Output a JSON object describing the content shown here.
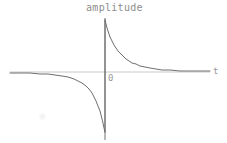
{
  "figure": {
    "background_color": "#ffffff",
    "width": 227,
    "height": 143,
    "title": "amplitude",
    "origin_label": "0",
    "t_axis_label": "t"
  },
  "chart_data": {
    "type": "line",
    "title": "amplitude",
    "xlabel": "t",
    "ylabel": "amplitude",
    "grid": false,
    "legend": null,
    "axes": {
      "x_axis": {
        "label": "t",
        "color": "#c8c8c8",
        "y_pixel": 72,
        "x_start_pixel": 10,
        "x_end_pixel": 210,
        "ticks": [],
        "tick_labels": []
      },
      "y_axis": {
        "label": "amplitude",
        "color": "#707070",
        "x_pixel": 105,
        "y_top_pixel": 18,
        "y_bottom_pixel": 140,
        "ticks": [],
        "tick_labels": []
      }
    },
    "origin": {
      "x_pixel": 105,
      "y_pixel": 72,
      "label": "0"
    },
    "series": [
      {
        "name": "positive-branch",
        "color": "#6e6e6e",
        "line_width": 1,
        "points_pixel": [
          [
            105,
            20
          ],
          [
            106,
            24
          ],
          [
            107,
            28
          ],
          [
            108,
            31
          ],
          [
            109,
            34
          ],
          [
            110,
            37
          ],
          [
            111,
            39
          ],
          [
            112,
            41
          ],
          [
            114,
            45
          ],
          [
            116,
            48
          ],
          [
            118,
            51
          ],
          [
            120,
            53
          ],
          [
            123,
            56
          ],
          [
            126,
            59
          ],
          [
            129,
            61
          ],
          [
            132,
            63
          ],
          [
            136,
            64
          ],
          [
            140,
            66
          ],
          [
            145,
            67
          ],
          [
            150,
            68
          ],
          [
            156,
            69
          ],
          [
            162,
            70
          ],
          [
            170,
            70
          ],
          [
            180,
            71
          ],
          [
            190,
            71
          ],
          [
            200,
            71
          ],
          [
            210,
            71
          ]
        ]
      },
      {
        "name": "negative-branch",
        "color": "#6e6e6e",
        "line_width": 1,
        "points_pixel": [
          [
            10,
            73
          ],
          [
            20,
            73
          ],
          [
            30,
            73
          ],
          [
            40,
            74
          ],
          [
            48,
            74
          ],
          [
            55,
            75
          ],
          [
            62,
            76
          ],
          [
            68,
            77
          ],
          [
            74,
            79
          ],
          [
            78,
            81
          ],
          [
            82,
            83
          ],
          [
            86,
            86
          ],
          [
            89,
            89
          ],
          [
            92,
            93
          ],
          [
            94,
            97
          ],
          [
            96,
            101
          ],
          [
            98,
            106
          ],
          [
            100,
            111
          ],
          [
            101,
            115
          ],
          [
            102,
            119
          ],
          [
            103,
            123
          ],
          [
            104,
            128
          ],
          [
            105,
            132
          ]
        ]
      },
      {
        "name": "impulse-stem",
        "color": "#6e6e6e",
        "line_width": 1,
        "points_pixel": [
          [
            105,
            20
          ],
          [
            105,
            132
          ]
        ]
      }
    ]
  }
}
